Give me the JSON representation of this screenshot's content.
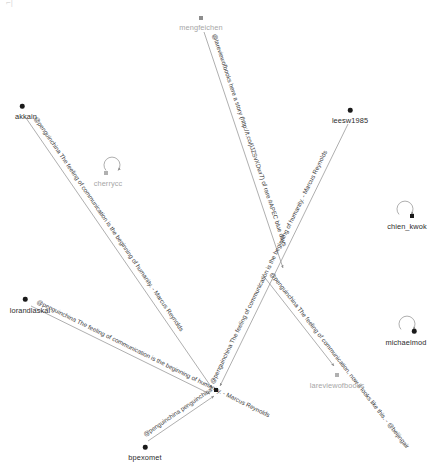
{
  "figure": {
    "type": "network-graph",
    "title": "",
    "background": "#ffffff",
    "node_color": "#1a1a1a",
    "node_color_secondary": "#a8a8a8",
    "edge_color": "#8c8c8c",
    "label_color": "#2b2b2b",
    "width": 446,
    "height": 468,
    "corner_mark": "⌐|"
  },
  "nodes": [
    {
      "id": "mengfeichen",
      "label": "mengfeichen",
      "x": 201,
      "y": 18,
      "color": "#8d8d8d",
      "shape": "square",
      "label_dx": 0,
      "label_dy": 5,
      "self_loop": false,
      "dim": true
    },
    {
      "id": "akkain",
      "label": "akkain",
      "x": 22,
      "y": 106,
      "color": "#1a1a1a",
      "shape": "round",
      "label_dx": 4,
      "label_dy": 6,
      "self_loop": false,
      "dim": false
    },
    {
      "id": "leesw1985",
      "label": "leesw1985",
      "x": 350,
      "y": 110,
      "color": "#1a1a1a",
      "shape": "round",
      "label_dx": 0,
      "label_dy": 6,
      "self_loop": false,
      "dim": false
    },
    {
      "id": "cherrycc",
      "label": "cherrycc",
      "x": 106,
      "y": 173,
      "color": "#b0b0b0",
      "shape": "square",
      "label_dx": 2,
      "label_dy": 6,
      "self_loop": true,
      "dim": true
    },
    {
      "id": "chien_kwok",
      "label": "chien_kwok",
      "x": 412,
      "y": 216,
      "color": "#1a1a1a",
      "shape": "square",
      "label_dx": -5,
      "label_dy": 6,
      "self_loop": true,
      "dim": false
    },
    {
      "id": "lorandlaskai",
      "label": "lorandlaskai",
      "x": 25,
      "y": 299,
      "color": "#1a1a1a",
      "shape": "round",
      "label_dx": 5,
      "label_dy": 7,
      "self_loop": false,
      "dim": false
    },
    {
      "id": "michaelmod",
      "label": "michaelmod",
      "x": 414,
      "y": 331,
      "color": "#1a1a1a",
      "shape": "round",
      "label_dx": -8,
      "label_dy": 7,
      "self_loop": true,
      "dim": false
    },
    {
      "id": "lareviewofbooks",
      "label": "lareviewofbooks",
      "x": 337,
      "y": 375,
      "color": "#b0b0b0",
      "shape": "square",
      "label_dx": 0,
      "label_dy": 6,
      "self_loop": false,
      "dim": true
    },
    {
      "id": "penguinchina",
      "label": "",
      "x": 216,
      "y": 390,
      "color": "#1a1a1a",
      "shape": "square",
      "label_dx": 0,
      "label_dy": 0,
      "self_loop": false,
      "dim": false
    },
    {
      "id": "bpexomet",
      "label": "bpexomet",
      "x": 145,
      "y": 447,
      "color": "#1a1a1a",
      "shape": "round",
      "label_dx": 0,
      "label_dy": 6,
      "self_loop": false,
      "dim": false
    }
  ],
  "edges": [
    {
      "id": "edge-akkain",
      "source": "akkain",
      "target": "penguinchina",
      "label": "@penguinchina  The feeling of communication is the beginning of humanity. - Marcus Reynolds",
      "x1": 26,
      "y1": 118,
      "x2": 212,
      "y2": 388
    },
    {
      "id": "edge-mengfeichen",
      "source": "mengfeichen",
      "target": "penguinchina",
      "label": "@lareviewofbooks here a story (http://t.co/jlJZSvXDwr7) of rare #APEC blue days",
      "x1": 204,
      "y1": 32,
      "x2": 283,
      "y2": 268
    },
    {
      "id": "edge-leesw1985",
      "source": "leesw1985",
      "target": "penguinchina",
      "label": "@penguinchina  The feeling of communication is the beginning of humanity. - Marcus Reynolds",
      "x1": 348,
      "y1": 124,
      "x2": 220,
      "y2": 386
    },
    {
      "id": "edge-lorandlaskai",
      "source": "lorandlaskai",
      "target": "penguinchina",
      "label": "@penguinchina  The feeling of communication is the beginning of humanity. - Marcus Reynolds",
      "x1": 31,
      "y1": 306,
      "x2": 210,
      "y2": 394
    },
    {
      "id": "edge-lareviewofbooks",
      "source": "penguinchina",
      "target": "lareviewofbooks",
      "label": "@penguinchina  The feeling of communication, now it looks like this. - @beijingair",
      "x1": 262,
      "y1": 274,
      "x2": 334,
      "y2": 366
    },
    {
      "id": "edge-bpexomet",
      "source": "bpexomet",
      "target": "penguinchina",
      "label": "@penguinchina  penguinchina",
      "x1": 148,
      "y1": 441,
      "x2": 214,
      "y2": 396
    }
  ],
  "self_loops": [
    {
      "id": "loop-cherrycc",
      "node": "cherrycc",
      "cx": 112,
      "cy": 166,
      "r": 8
    },
    {
      "id": "loop-chien_kwok",
      "node": "chien_kwok",
      "cx": 405,
      "cy": 210,
      "r": 8
    },
    {
      "id": "loop-michaelmod",
      "node": "michaelmod",
      "cx": 407,
      "cy": 325,
      "r": 8
    }
  ]
}
